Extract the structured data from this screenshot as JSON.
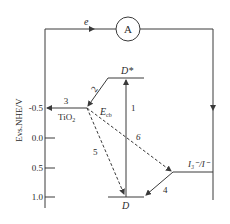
{
  "diagram": {
    "y_axis": {
      "label": "Evs.NHE/V",
      "ticks": [
        "-0.5",
        "0.0",
        "0.5",
        "1.0"
      ]
    },
    "circuit": {
      "electron_label": "e",
      "ammeter_label": "A"
    },
    "levels": {
      "excited_dye": "D*",
      "ground_dye": "D",
      "conduction_band": "E",
      "conduction_band_sub": "cb",
      "semiconductor": "TiO",
      "semiconductor_sub": "2",
      "redox": "I₃⁻/I⁻"
    },
    "processes": {
      "p1": "1",
      "p2": "2",
      "p3": "3",
      "p4": "4",
      "p5": "5",
      "p6": "6"
    },
    "colors": {
      "line": "#3a3a3a",
      "text": "#2a2a2a",
      "background": "#ffffff"
    }
  }
}
